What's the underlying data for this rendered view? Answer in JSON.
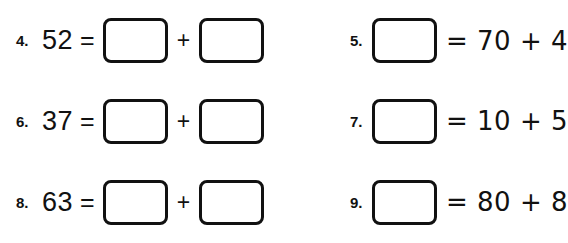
{
  "page": {
    "background_color": "#ffffff",
    "ink_color": "#111111",
    "type": "math-worksheet"
  },
  "problems": [
    {
      "number": "4.",
      "layout": "value-equals-box-plus-box",
      "value": "52",
      "equals": "=",
      "plus": "+",
      "box1_value": "",
      "box2_value": "",
      "box1_placeholder": "",
      "box2_placeholder": ""
    },
    {
      "number": "5.",
      "layout": "box-equals-expression",
      "equals_expression": "= 70 + 4",
      "box_value": "",
      "box_placeholder": ""
    },
    {
      "number": "6.",
      "layout": "value-equals-box-plus-box",
      "value": "37",
      "equals": "=",
      "plus": "+",
      "box1_value": "",
      "box2_value": "",
      "box1_placeholder": "",
      "box2_placeholder": ""
    },
    {
      "number": "7.",
      "layout": "box-equals-expression",
      "equals_expression": "= 10 + 5",
      "box_value": "",
      "box_placeholder": ""
    },
    {
      "number": "8.",
      "layout": "value-equals-box-plus-box",
      "value": "63",
      "equals": "=",
      "plus": "+",
      "box1_value": "",
      "box2_value": "",
      "box1_placeholder": "",
      "box2_placeholder": ""
    },
    {
      "number": "9.",
      "layout": "box-equals-expression",
      "equals_expression": "= 80 + 8",
      "box_value": "",
      "box_placeholder": ""
    }
  ]
}
